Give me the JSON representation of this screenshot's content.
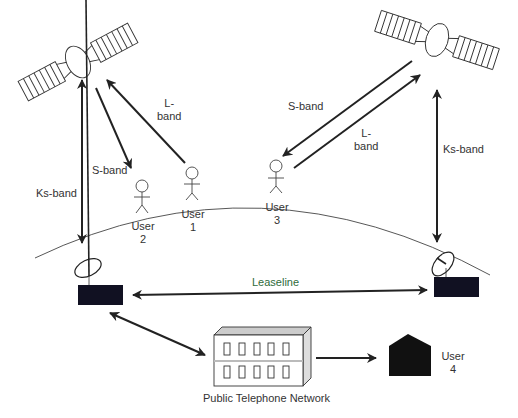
{
  "diagram": {
    "labels": {
      "l_band_left_1": "L-",
      "l_band_left_2": "band",
      "s_band_left": "S-band",
      "ks_band_left": "Ks-band",
      "s_band_right": "S-band",
      "l_band_right_1": "L-",
      "l_band_right_2": "band",
      "ks_band_right": "Ks-band",
      "leaseline": "Leaseline",
      "pstn": "Public Telephone Network"
    },
    "users": [
      {
        "line1": "User",
        "line2": "1"
      },
      {
        "line1": "User",
        "line2": "2"
      },
      {
        "line1": "User",
        "line2": "3"
      },
      {
        "line1": "User",
        "line2": "4"
      }
    ],
    "colors": {
      "stroke": "#222222",
      "fill_dark": "#111122",
      "leaseline_text": "#2e6b3a"
    }
  }
}
